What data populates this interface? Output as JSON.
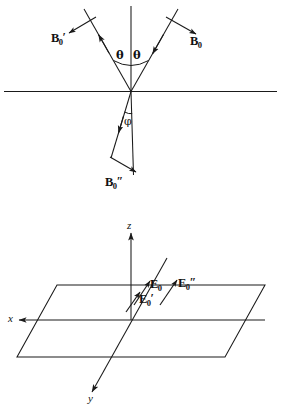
{
  "figure": {
    "background_color": "#ffffff",
    "stroke_color": "#1a1a1a",
    "panels": [
      {
        "id": "upper",
        "name": "reflection-refraction-diagram",
        "description": "Incident, reflected and transmitted magnetic field vectors at a planar interface",
        "interface_line_label": "",
        "labels": {
          "incident_field": {
            "base": "B",
            "subscript": "0",
            "primes": ""
          },
          "reflected_field": {
            "base": "B",
            "subscript": "0",
            "primes": "′"
          },
          "transmitted_field": {
            "base": "B",
            "subscript": "0",
            "primes": "″"
          },
          "angle_incidence": "θ",
          "angle_reflection": "θ",
          "angle_refraction": "φ"
        }
      },
      {
        "id": "lower",
        "name": "coordinate-plane-diagram",
        "description": "Electric field amplitude vectors at the origin of an x-y-z coordinate system with the interface plane drawn in perspective",
        "axes": {
          "vertical": "z",
          "left": "x",
          "depth": "y"
        },
        "labels": {
          "incident_field": {
            "base": "E",
            "subscript": "0",
            "primes": ""
          },
          "reflected_field": {
            "base": "E",
            "subscript": "0",
            "primes": "′"
          },
          "transmitted_field": {
            "base": "E",
            "subscript": "0",
            "primes": "″"
          }
        }
      }
    ]
  }
}
